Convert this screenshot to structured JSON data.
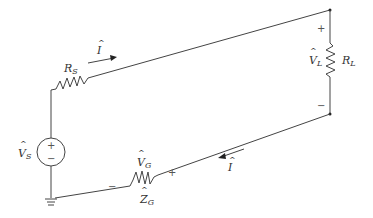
{
  "diagram": {
    "type": "circuit",
    "components": {
      "source": {
        "symbol": "V",
        "hat": true,
        "subscript": "S",
        "plus": "+",
        "minus": "−"
      },
      "source_resistor": {
        "symbol": "R",
        "subscript": "S"
      },
      "load_resistor": {
        "symbol": "R",
        "subscript": "L"
      },
      "load_voltage": {
        "symbol": "V",
        "hat": true,
        "subscript": "L",
        "plus": "+",
        "minus": "−"
      },
      "ground_impedance": {
        "symbol": "Z",
        "hat": true,
        "subscript": "G"
      },
      "ground_voltage": {
        "symbol": "V",
        "hat": true,
        "subscript": "G",
        "plus": "+",
        "minus": "−"
      },
      "current_top": {
        "symbol": "I",
        "hat": true
      },
      "current_bottom": {
        "symbol": "I",
        "hat": true
      }
    },
    "colors": {
      "wire": "#444444",
      "text": "#333333"
    }
  }
}
